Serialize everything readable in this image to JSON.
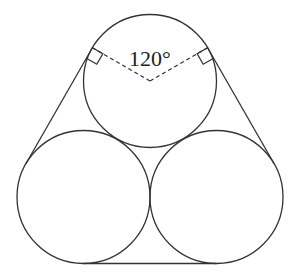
{
  "diagram": {
    "angle_label": "120°",
    "angle_value_degrees": 120,
    "circle_count": 3,
    "right_angle_markers": 2,
    "colors": {
      "stroke": "#333333",
      "background": "#ffffff"
    }
  }
}
